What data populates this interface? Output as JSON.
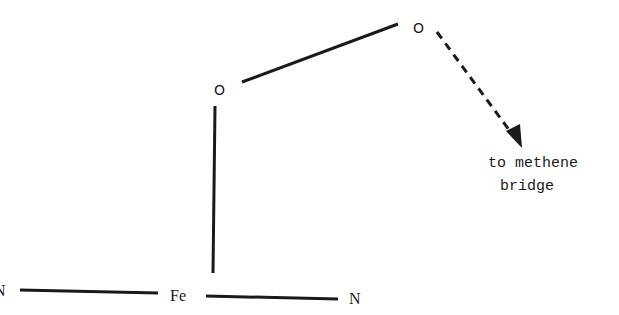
{
  "diagram": {
    "type": "chemical-structure",
    "atoms": {
      "oxygen_upper": "O",
      "oxygen_lower": "O",
      "iron": "Fe",
      "nitrogen_left": "N",
      "nitrogen_right": "N"
    },
    "annotation": {
      "line1": "to methene",
      "line2": "bridge"
    },
    "bonds": [
      {
        "from": "Fe",
        "to": "N (left)",
        "style": "solid"
      },
      {
        "from": "Fe",
        "to": "N (right)",
        "style": "solid"
      },
      {
        "from": "Fe",
        "to": "O (lower)",
        "style": "solid"
      },
      {
        "from": "O (lower)",
        "to": "O (upper)",
        "style": "solid"
      },
      {
        "from": "O (upper)",
        "to": "methene bridge",
        "style": "dashed-arrow"
      }
    ],
    "colors": {
      "ink": "#1a1a1a",
      "background": "#ffffff"
    }
  }
}
